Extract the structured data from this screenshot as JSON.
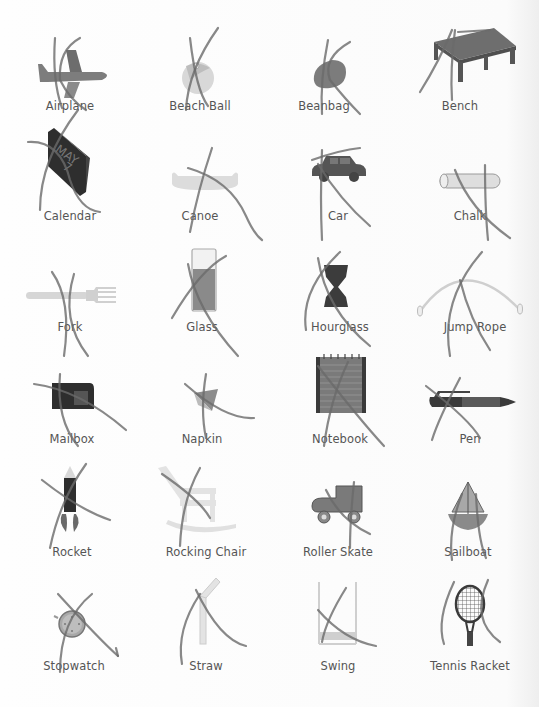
{
  "worksheet": {
    "items": [
      {
        "label": "Airplane",
        "icon": "airplane-icon",
        "crossed_out": true
      },
      {
        "label": "Beach Ball",
        "icon": "beach-ball-icon",
        "crossed_out": true
      },
      {
        "label": "Beanbag",
        "icon": "beanbag-icon",
        "crossed_out": true
      },
      {
        "label": "Bench",
        "icon": "bench-icon",
        "crossed_out": true
      },
      {
        "label": "Calendar",
        "icon": "calendar-icon",
        "crossed_out": true
      },
      {
        "label": "Canoe",
        "icon": "canoe-icon",
        "crossed_out": true
      },
      {
        "label": "Car",
        "icon": "car-icon",
        "crossed_out": true
      },
      {
        "label": "Chalk",
        "icon": "chalk-icon",
        "crossed_out": true
      },
      {
        "label": "Fork",
        "icon": "fork-icon",
        "crossed_out": true
      },
      {
        "label": "Glass",
        "icon": "glass-icon",
        "crossed_out": true
      },
      {
        "label": "Hourglass",
        "icon": "hourglass-icon",
        "crossed_out": true
      },
      {
        "label": "Jump Rope",
        "icon": "jump-rope-icon",
        "crossed_out": true
      },
      {
        "label": "Mailbox",
        "icon": "mailbox-icon",
        "crossed_out": true
      },
      {
        "label": "Napkin",
        "icon": "napkin-icon",
        "crossed_out": true
      },
      {
        "label": "Notebook",
        "icon": "notebook-icon",
        "crossed_out": true
      },
      {
        "label": "Pen",
        "icon": "pen-icon",
        "crossed_out": true
      },
      {
        "label": "Rocket",
        "icon": "rocket-icon",
        "crossed_out": true
      },
      {
        "label": "Rocking Chair",
        "icon": "rocking-chair-icon",
        "crossed_out": true
      },
      {
        "label": "Roller Skate",
        "icon": "roller-skate-icon",
        "crossed_out": true
      },
      {
        "label": "Sailboat",
        "icon": "sailboat-icon",
        "crossed_out": true
      },
      {
        "label": "Stopwatch",
        "icon": "stopwatch-icon",
        "crossed_out": true
      },
      {
        "label": "Straw",
        "icon": "straw-icon",
        "crossed_out": true
      },
      {
        "label": "Swing",
        "icon": "swing-icon",
        "crossed_out": true
      },
      {
        "label": "Tennis Racket",
        "icon": "tennis-racket-icon",
        "crossed_out": true
      }
    ],
    "calendar_text": {
      "month": "MAY",
      "day": "7"
    },
    "colors": {
      "background": "#fdfdfd",
      "label_text": "#555555",
      "dark_icon": "#3a3a3a",
      "mid_icon": "#7a7a7a",
      "light_icon": "#cfcfcf",
      "pencil_stroke": "#6a6a6a"
    }
  }
}
